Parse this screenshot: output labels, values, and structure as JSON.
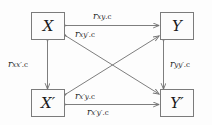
{
  "diagram": {
    "type": "cross-lagged-panel-path-diagram",
    "nodes": [
      {
        "id": "X",
        "label": "X",
        "position": "top-left"
      },
      {
        "id": "Y",
        "label": "Y",
        "position": "top-right"
      },
      {
        "id": "Xp",
        "label": "X′",
        "position": "bottom-left"
      },
      {
        "id": "Yp",
        "label": "Y′",
        "position": "bottom-right"
      }
    ],
    "edges": [
      {
        "id": "x-y",
        "from": "X",
        "to": "Y",
        "arrow": "both",
        "label": "r",
        "sub": "xy",
        "suffix": ".c",
        "label_full": "r_xy.c",
        "label_position": "above-top-horizontal"
      },
      {
        "id": "x-yp",
        "from": "X",
        "to": "Yp",
        "arrow": "both",
        "label": "r",
        "sub": "xy′",
        "suffix": ".c",
        "label_full": "r_xy′.c",
        "label_position": "below-top-left-diagonal-start"
      },
      {
        "id": "x-xp",
        "from": "X",
        "to": "Xp",
        "arrow": "both",
        "label": "r",
        "sub": "xx′",
        "suffix": ".c",
        "label_full": "r_xx′.c",
        "label_position": "left-of-left-vertical"
      },
      {
        "id": "y-yp",
        "from": "Y",
        "to": "Yp",
        "arrow": "both",
        "label": "r",
        "sub": "yy′",
        "suffix": ".c",
        "label_full": "r_yy′.c",
        "label_position": "right-of-right-vertical"
      },
      {
        "id": "xp-y",
        "from": "Xp",
        "to": "Y",
        "arrow": "both",
        "label": "r",
        "sub": "x′y",
        "suffix": ".c",
        "label_full": "r_x′y.c",
        "label_position": "above-bottom-left-diagonal-start"
      },
      {
        "id": "xp-yp",
        "from": "Xp",
        "to": "Yp",
        "arrow": "both",
        "label": "r",
        "sub": "x′y′",
        "suffix": ".c",
        "label_full": "r_x′y′.c",
        "label_position": "below-bottom-horizontal"
      }
    ],
    "colors": {
      "line": "#6f6f6f",
      "box_border": "#7b7b7b",
      "text": "#1a1a1a",
      "background": "#fdfdfd"
    }
  }
}
